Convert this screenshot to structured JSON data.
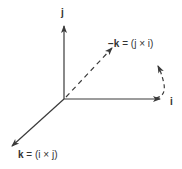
{
  "diagram": {
    "type": "3d-coordinate-axes-cross-product",
    "colors": {
      "line": "#3a3a3a",
      "text": "#333333",
      "background": "#ffffff"
    },
    "axes": [
      {
        "id": "j",
        "label": "j",
        "direction": "up",
        "style": "solid"
      },
      {
        "id": "i",
        "label": "i",
        "direction": "right",
        "style": "solid"
      },
      {
        "id": "k",
        "label": "k = (i × j)",
        "label_bold": "k",
        "label_rest": " = (i × j)",
        "direction": "down-left",
        "style": "solid"
      },
      {
        "id": "neg-k",
        "label": "−k = (j × i)",
        "label_bold": "−k",
        "label_rest": " = (j × i)",
        "direction": "up-right",
        "style": "dashed"
      }
    ],
    "rotation_arrow": {
      "description": "curved dashed arrow from i-axis tip curving upward",
      "style": "dashed"
    }
  }
}
